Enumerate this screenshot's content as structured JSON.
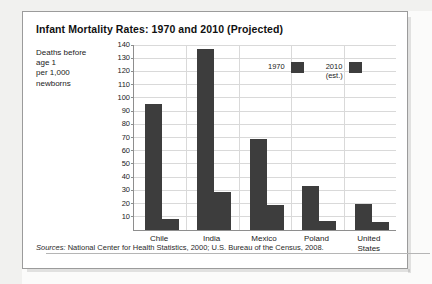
{
  "figure": {
    "title": "Infant Mortality Rates: 1970 and 2010 (Projected)",
    "y_caption_lines": [
      "Deaths before",
      "age 1",
      "per 1,000",
      "newborns"
    ],
    "source_label": "Sources:",
    "source_text": " National Center for Health Statistics, 2000; U.S. Bureau of the Census, 2008."
  },
  "colors": {
    "bar": "#3d3d3d",
    "grid": "#d9d9d9",
    "axis": "#8e8e8e",
    "frame": "#9b9b9b",
    "text": "#1a1a1a"
  },
  "chart_data": {
    "type": "bar",
    "title": "Infant Mortality Rates: 1970 and 2010 (Projected)",
    "xlabel": "",
    "ylabel": "Deaths before age 1 per 1,000 newborns",
    "ylim": [
      0,
      140
    ],
    "ytick_step": 10,
    "yticks": [
      10,
      20,
      30,
      40,
      50,
      60,
      70,
      80,
      90,
      100,
      110,
      120,
      130,
      140
    ],
    "ytick_labels": [
      "10",
      "20",
      "30",
      "40",
      "50",
      "60",
      "70",
      "80",
      "90",
      "100",
      "110",
      "120",
      "130",
      "140"
    ],
    "grid": true,
    "legend_position": "top-center",
    "categories": [
      "Chile",
      "India",
      "Mexico",
      "Poland",
      "United States"
    ],
    "category_label_lines": [
      [
        "Chile"
      ],
      [
        "India"
      ],
      [
        "Mexico"
      ],
      [
        "Poland"
      ],
      [
        "United",
        "States"
      ]
    ],
    "series": [
      {
        "name": "1970",
        "legend_lines": [
          "1970"
        ],
        "color": "#3d3d3d",
        "values": [
          95,
          137,
          69,
          33,
          20
        ]
      },
      {
        "name": "2010 (est.)",
        "legend_lines": [
          "2010",
          "(est.)"
        ],
        "color": "#3d3d3d",
        "values": [
          8,
          29,
          19,
          7,
          6
        ]
      }
    ]
  }
}
